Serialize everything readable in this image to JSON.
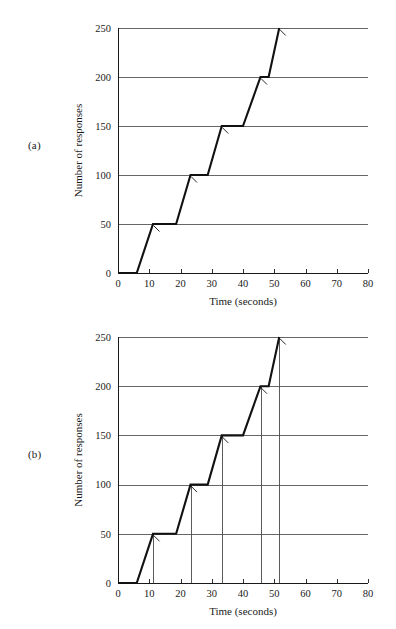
{
  "figure": {
    "panels": [
      {
        "tag": "(a)",
        "id": "a",
        "has_droplines": false
      },
      {
        "tag": "(b)",
        "id": "b",
        "has_droplines": true
      }
    ]
  },
  "chart_data": [
    {
      "type": "line",
      "panel": "(a)",
      "title": "",
      "xlabel": "Time (seconds)",
      "ylabel": "Number of responses",
      "xlim": [
        0,
        80
      ],
      "ylim": [
        0,
        250
      ],
      "xticks": [
        0,
        10,
        20,
        30,
        40,
        50,
        60,
        70,
        80
      ],
      "xticklabels": [
        "0",
        "10",
        "20",
        "30",
        "40",
        "50",
        "60",
        "70",
        "80"
      ],
      "yticks": [
        0,
        50,
        100,
        150,
        200,
        250
      ],
      "yticklabels": [
        "0",
        "50",
        "100",
        "150",
        "200",
        "250"
      ],
      "grid": "horizontal",
      "legend": "none",
      "series": [
        {
          "name": "cumulative responses",
          "x": [
            0,
            6.0,
            11.2,
            18.6,
            23.2,
            28.7,
            33.2,
            40.0,
            45.6,
            48.2,
            51.6
          ],
          "y": [
            0,
            0,
            50,
            50,
            100,
            100,
            150,
            150,
            200,
            200,
            250
          ]
        }
      ],
      "reinforcement_marks": [
        {
          "x": 11.2,
          "y": 50
        },
        {
          "x": 23.2,
          "y": 100
        },
        {
          "x": 33.2,
          "y": 150
        },
        {
          "x": 45.6,
          "y": 200
        },
        {
          "x": 51.6,
          "y": 250
        }
      ],
      "droplines": []
    },
    {
      "type": "line",
      "panel": "(b)",
      "title": "",
      "xlabel": "Time (seconds)",
      "ylabel": "Number of responses",
      "xlim": [
        0,
        80
      ],
      "ylim": [
        0,
        250
      ],
      "xticks": [
        0,
        10,
        20,
        30,
        40,
        50,
        60,
        70,
        80
      ],
      "xticklabels": [
        "0",
        "10",
        "20",
        "30",
        "40",
        "50",
        "60",
        "70",
        "80"
      ],
      "yticks": [
        0,
        50,
        100,
        150,
        200,
        250
      ],
      "yticklabels": [
        "0",
        "50",
        "100",
        "150",
        "200",
        "250"
      ],
      "grid": "horizontal",
      "legend": "none",
      "series": [
        {
          "name": "cumulative responses",
          "x": [
            0,
            6.0,
            11.2,
            18.6,
            23.2,
            28.7,
            33.2,
            40.0,
            45.6,
            48.2,
            51.6
          ],
          "y": [
            0,
            0,
            50,
            50,
            100,
            100,
            150,
            150,
            200,
            200,
            250
          ]
        }
      ],
      "reinforcement_marks": [
        {
          "x": 11.2,
          "y": 50
        },
        {
          "x": 23.2,
          "y": 100
        },
        {
          "x": 33.2,
          "y": 150
        },
        {
          "x": 45.6,
          "y": 200
        },
        {
          "x": 51.6,
          "y": 250
        }
      ],
      "droplines": [
        {
          "x": 11.2,
          "y_top": 50
        },
        {
          "x": 23.2,
          "y_top": 100
        },
        {
          "x": 33.2,
          "y_top": 150
        },
        {
          "x": 45.6,
          "y_top": 200
        },
        {
          "x": 51.6,
          "y_top": 250
        }
      ]
    }
  ]
}
